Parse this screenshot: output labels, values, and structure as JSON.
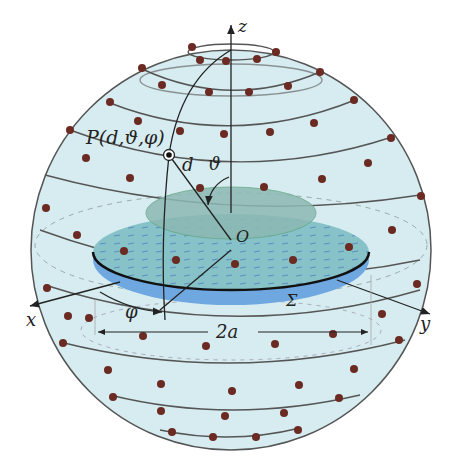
{
  "labels": {
    "z_axis": "z",
    "x_axis": "x",
    "y_axis": "y",
    "point": "P(d,ϑ,φ)",
    "distance": "d",
    "polar_angle": "ϑ",
    "azimuth": "φ",
    "origin": "O",
    "surface": "Σ",
    "diameter": "2a"
  },
  "colors": {
    "sphere_fill": "#d6ecf0",
    "sphere_stroke": "#555555",
    "disk_outer": "#6fa8e0",
    "disk_top": "#7fbcc4",
    "disk_inner": "#8db9b4",
    "node_dot": "#6b2a22",
    "line": "#222222"
  }
}
